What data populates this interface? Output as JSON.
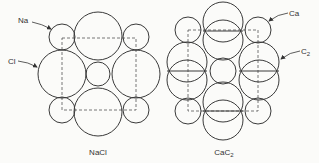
{
  "diagram": {
    "nacl": {
      "caption": "NaCl",
      "labels": {
        "na": "Na",
        "cl": "Cl"
      }
    },
    "cac2": {
      "caption_main": "CaC",
      "caption_sub": "2",
      "labels": {
        "ca": "Ca",
        "c2_main": "C",
        "c2_sub": "2"
      }
    },
    "colors": {
      "line": "#3a3a3a",
      "background": "#fbfbf9"
    }
  }
}
